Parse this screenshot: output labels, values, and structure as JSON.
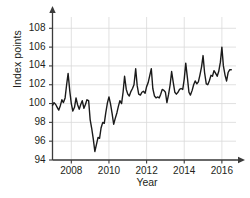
{
  "chart_data": {
    "type": "line",
    "title": "",
    "xlabel": "Year",
    "ylabel": "Index points",
    "xlim": [
      2007.0,
      2016.75
    ],
    "ylim": [
      94,
      109.2
    ],
    "grid": true,
    "legend": null,
    "yticks": [
      94,
      96,
      98,
      100,
      102,
      104,
      106,
      108
    ],
    "ytick_labels": [
      "94",
      "96",
      "98",
      "100",
      "102",
      "104",
      "106",
      "108"
    ],
    "xticks": [
      2008,
      2010,
      2012,
      2014,
      2016
    ],
    "xtick_labels": [
      "2008",
      "2010",
      "2012",
      "2014",
      "2016"
    ],
    "line_color": "#1a1a1a",
    "grid_color": "#d9d9d9",
    "axis_color": "#3b3b3b",
    "background": "#ffffff",
    "series": [
      {
        "name": "Index",
        "x": [
          2007.0,
          2007.08,
          2007.17,
          2007.25,
          2007.33,
          2007.42,
          2007.5,
          2007.58,
          2007.67,
          2007.75,
          2007.83,
          2007.92,
          2008.0,
          2008.08,
          2008.17,
          2008.25,
          2008.33,
          2008.42,
          2008.5,
          2008.58,
          2008.67,
          2008.75,
          2008.83,
          2008.92,
          2009.0,
          2009.08,
          2009.17,
          2009.25,
          2009.33,
          2009.42,
          2009.5,
          2009.58,
          2009.67,
          2009.75,
          2009.83,
          2009.92,
          2010.0,
          2010.08,
          2010.17,
          2010.25,
          2010.33,
          2010.42,
          2010.5,
          2010.58,
          2010.67,
          2010.75,
          2010.83,
          2010.92,
          2011.0,
          2011.08,
          2011.17,
          2011.25,
          2011.33,
          2011.42,
          2011.5,
          2011.58,
          2011.67,
          2011.75,
          2011.83,
          2011.92,
          2012.0,
          2012.08,
          2012.17,
          2012.25,
          2012.33,
          2012.42,
          2012.5,
          2012.58,
          2012.67,
          2012.75,
          2012.83,
          2012.92,
          2013.0,
          2013.08,
          2013.17,
          2013.25,
          2013.33,
          2013.42,
          2013.5,
          2013.58,
          2013.67,
          2013.75,
          2013.83,
          2013.92,
          2014.0,
          2014.08,
          2014.17,
          2014.25,
          2014.33,
          2014.42,
          2014.5,
          2014.58,
          2014.67,
          2014.75,
          2014.83,
          2014.92,
          2015.0,
          2015.08,
          2015.17,
          2015.25,
          2015.33,
          2015.42,
          2015.5,
          2015.58,
          2015.67,
          2015.75,
          2015.83,
          2015.92,
          2016.0,
          2016.08,
          2016.17,
          2016.25,
          2016.33,
          2016.42,
          2016.5
        ],
        "values": [
          99.8,
          100.1,
          99.9,
          99.6,
          99.3,
          99.8,
          100.4,
          100.1,
          100.6,
          102.0,
          103.2,
          101.3,
          100.0,
          99.2,
          99.6,
          100.6,
          99.9,
          99.4,
          99.9,
          100.3,
          99.5,
          99.9,
          100.4,
          100.3,
          98.3,
          97.4,
          96.2,
          94.9,
          95.6,
          96.4,
          96.3,
          97.4,
          98.0,
          97.9,
          99.0,
          100.1,
          100.7,
          100.0,
          98.9,
          97.8,
          98.4,
          99.0,
          99.7,
          100.3,
          100.0,
          101.2,
          102.9,
          101.5,
          101.0,
          100.8,
          101.3,
          101.6,
          102.0,
          103.7,
          101.9,
          101.0,
          100.9,
          101.2,
          101.3,
          101.1,
          101.8,
          102.2,
          103.0,
          103.7,
          101.6,
          100.8,
          100.6,
          100.7,
          100.6,
          101.0,
          101.5,
          101.4,
          101.2,
          100.1,
          101.0,
          102.0,
          103.4,
          102.2,
          101.2,
          101.0,
          101.2,
          101.5,
          101.6,
          101.5,
          102.6,
          104.3,
          102.7,
          101.2,
          100.9,
          101.4,
          102.0,
          102.4,
          102.1,
          102.3,
          103.0,
          103.9,
          105.1,
          103.3,
          102.1,
          102.0,
          102.4,
          103.0,
          102.9,
          103.5,
          103.2,
          102.9,
          103.4,
          104.4,
          106.0,
          104.0,
          103.0,
          102.4,
          103.3,
          103.6,
          103.6
        ]
      }
    ]
  }
}
